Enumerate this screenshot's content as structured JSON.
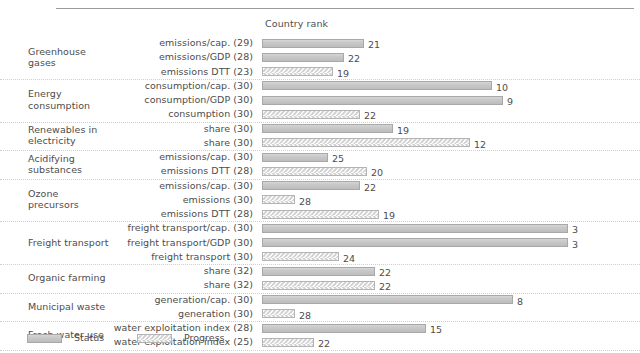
{
  "header": {
    "column_title": "Country rank"
  },
  "legend": {
    "items": [
      {
        "key": "status",
        "label": "Status",
        "swatch": "solid-gray-bar"
      },
      {
        "key": "progress",
        "label": "Progress",
        "swatch": "chevron-pattern-bar"
      }
    ]
  },
  "chart_data": {
    "type": "bar",
    "title": "Country rank",
    "xlabel": "",
    "ylabel": "",
    "orientation": "horizontal",
    "grid": "dotted-row-separators",
    "legend_position": "bottom-left",
    "value_label_note": "Number at the end of each bar is the country rank; bar length is inversely proportional to rank (rank 1 = longest).",
    "series": [
      {
        "name": "Status",
        "pattern": "solid"
      },
      {
        "name": "Progress",
        "pattern": "chevron"
      }
    ],
    "groups": [
      {
        "group": "Greenhouse\ngases",
        "rows": [
          {
            "label": "emissions/cap. (29)",
            "indicator": "emissions/cap.",
            "total": 29,
            "series": "Status",
            "value": 21
          },
          {
            "label": "emissions/GDP (28)",
            "indicator": "emissions/GDP",
            "total": 28,
            "series": "Status",
            "value": 22
          },
          {
            "label": "emissions DTT (23)",
            "indicator": "emissions DTT",
            "total": 23,
            "series": "Progress",
            "value": 19
          }
        ]
      },
      {
        "group": "Energy\nconsumption",
        "rows": [
          {
            "label": "consumption/cap. (30)",
            "indicator": "consumption/cap.",
            "total": 30,
            "series": "Status",
            "value": 10
          },
          {
            "label": "consumption/GDP (30)",
            "indicator": "consumption/GDP",
            "total": 30,
            "series": "Status",
            "value": 9
          },
          {
            "label": "consumption (30)",
            "indicator": "consumption",
            "total": 30,
            "series": "Progress",
            "value": 22
          }
        ]
      },
      {
        "group": "Renewables in\nelectricity",
        "rows": [
          {
            "label": "share (30)",
            "indicator": "share",
            "total": 30,
            "series": "Status",
            "value": 19
          },
          {
            "label": "share (30)",
            "indicator": "share",
            "total": 30,
            "series": "Progress",
            "value": 12
          }
        ]
      },
      {
        "group": "Acidifying\nsubstances",
        "rows": [
          {
            "label": "emissions/cap. (30)",
            "indicator": "emissions/cap.",
            "total": 30,
            "series": "Status",
            "value": 25
          },
          {
            "label": "emissions DTT (28)",
            "indicator": "emissions DTT",
            "total": 28,
            "series": "Progress",
            "value": 20
          }
        ]
      },
      {
        "group": "Ozone\nprecursors",
        "rows": [
          {
            "label": "emissions/cap. (30)",
            "indicator": "emissions/cap.",
            "total": 30,
            "series": "Status",
            "value": 22
          },
          {
            "label": "emissions (30)",
            "indicator": "emissions",
            "total": 30,
            "series": "Progress",
            "value": 28
          },
          {
            "label": "emissions DTT (28)",
            "indicator": "emissions DTT",
            "total": 28,
            "series": "Progress",
            "value": 19
          }
        ]
      },
      {
        "group": "Freight transport",
        "rows": [
          {
            "label": "freight transport/cap. (30)",
            "indicator": "freight transport/cap.",
            "total": 30,
            "series": "Status",
            "value": 3
          },
          {
            "label": "freight transport/GDP (30)",
            "indicator": "freight transport/GDP",
            "total": 30,
            "series": "Status",
            "value": 3
          },
          {
            "label": "freight transport (30)",
            "indicator": "freight transport",
            "total": 30,
            "series": "Progress",
            "value": 24
          }
        ]
      },
      {
        "group": "Organic farming",
        "rows": [
          {
            "label": "share (32)",
            "indicator": "share",
            "total": 32,
            "series": "Status",
            "value": 22
          },
          {
            "label": "share (32)",
            "indicator": "share",
            "total": 32,
            "series": "Progress",
            "value": 22
          }
        ]
      },
      {
        "group": "Municipal waste",
        "rows": [
          {
            "label": "generation/cap. (30)",
            "indicator": "generation/cap.",
            "total": 30,
            "series": "Status",
            "value": 8
          },
          {
            "label": "generation (30)",
            "indicator": "generation",
            "total": 30,
            "series": "Progress",
            "value": 28
          }
        ]
      },
      {
        "group": "Fresh water use",
        "rows": [
          {
            "label": "water exploitation index (28)",
            "indicator": "water exploitation index",
            "total": 28,
            "series": "Status",
            "value": 15
          },
          {
            "label": "water exploitation index (25)",
            "indicator": "water exploitation index",
            "total": 25,
            "series": "Progress",
            "value": 22
          }
        ]
      }
    ]
  },
  "colors": {
    "status_fill": "#c9c9c9",
    "status_border": "#a8a8a8",
    "progress_border": "#b4b4b4",
    "progress_pattern": "#d2d2d2",
    "text": "#4d4d4d",
    "separator": "#cfcfcf",
    "top_rule": "#9a9a9a",
    "background": "#ffffff"
  }
}
